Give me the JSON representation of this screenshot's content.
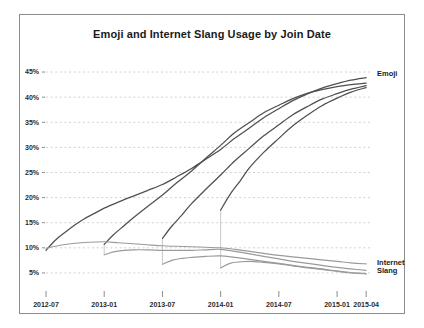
{
  "chart_data": {
    "type": "line",
    "title": "Emoji and Internet Slang Usage by Join Date",
    "xlabel": "",
    "ylabel": "",
    "grid": true,
    "legend_position": "right-inline",
    "ylim": [
      2,
      47
    ],
    "ytick_labels": [
      "45%",
      "40%",
      "35%",
      "30%",
      "25%",
      "20%",
      "15%",
      "10%",
      "5%"
    ],
    "ytick_values": [
      45,
      40,
      35,
      30,
      25,
      20,
      15,
      10,
      5
    ],
    "xtick_labels": [
      "2012-07",
      "2013-01",
      "2013-07",
      "2014-01",
      "2014-07",
      "2015-01",
      "2015-04"
    ],
    "xtick_values": [
      2012.5,
      2013.0,
      2013.5,
      2014.0,
      2014.5,
      2015.0,
      2015.25
    ],
    "xlim": [
      2012.5,
      2015.3
    ],
    "series_labels": {
      "emoji": "Emoji",
      "internet": "Internet",
      "slang": "Slang"
    },
    "series": [
      {
        "name": "Emoji — cohort joined 2012-07",
        "group": "emoji",
        "color": "#4f4f4f",
        "x": [
          2012.5,
          2012.58,
          2012.67,
          2012.75,
          2012.83,
          2012.92,
          2013.0,
          2013.12,
          2013.25,
          2013.37,
          2013.5,
          2013.62,
          2013.75,
          2013.87,
          2014.0,
          2014.12,
          2014.25,
          2014.37,
          2014.5,
          2014.62,
          2014.75,
          2014.87,
          2015.0,
          2015.12,
          2015.25
        ],
        "values": [
          9.5,
          11.5,
          13.2,
          14.6,
          15.8,
          16.9,
          17.9,
          19.1,
          20.3,
          21.4,
          22.6,
          24.1,
          25.8,
          27.6,
          29.6,
          31.8,
          33.9,
          35.9,
          37.7,
          39.3,
          40.7,
          41.8,
          42.7,
          43.4,
          43.9
        ]
      },
      {
        "name": "Emoji — cohort joined 2013-01",
        "group": "emoji",
        "color": "#4f4f4f",
        "x": [
          2013.0,
          2013.08,
          2013.17,
          2013.25,
          2013.37,
          2013.5,
          2013.62,
          2013.75,
          2013.87,
          2014.0,
          2014.12,
          2014.25,
          2014.37,
          2014.5,
          2014.62,
          2014.75,
          2014.87,
          2015.0,
          2015.12,
          2015.25
        ],
        "values": [
          10.7,
          12.6,
          14.4,
          16.0,
          18.2,
          20.5,
          22.9,
          25.3,
          27.8,
          30.4,
          32.9,
          35.0,
          36.9,
          38.4,
          39.7,
          40.8,
          41.5,
          42.1,
          42.5,
          42.8
        ]
      },
      {
        "name": "Emoji — cohort joined 2013-07",
        "group": "emoji",
        "color": "#4f4f4f",
        "x": [
          2013.5,
          2013.58,
          2013.67,
          2013.75,
          2013.87,
          2014.0,
          2014.12,
          2014.25,
          2014.37,
          2014.5,
          2014.62,
          2014.75,
          2014.87,
          2015.0,
          2015.12,
          2015.25
        ],
        "values": [
          11.9,
          14.3,
          16.6,
          18.8,
          21.6,
          24.5,
          27.3,
          29.9,
          32.3,
          34.5,
          36.5,
          38.2,
          39.6,
          40.7,
          41.6,
          42.3
        ]
      },
      {
        "name": "Emoji — cohort joined 2014-01",
        "group": "emoji",
        "color": "#4f4f4f",
        "x": [
          2014.0,
          2014.08,
          2014.17,
          2014.25,
          2014.37,
          2014.5,
          2014.62,
          2014.75,
          2014.87,
          2015.0,
          2015.12,
          2015.25
        ],
        "values": [
          17.5,
          20.6,
          23.4,
          26.0,
          29.0,
          31.8,
          34.3,
          36.5,
          38.3,
          39.8,
          41.0,
          41.9
        ]
      },
      {
        "name": "Internet Slang — cohort joined 2012-07",
        "group": "slang",
        "color": "#9a9a9a",
        "x": [
          2012.5,
          2012.62,
          2012.75,
          2012.87,
          2013.0,
          2013.12,
          2013.25,
          2013.37,
          2013.5,
          2013.62,
          2013.75,
          2013.87,
          2014.0,
          2014.12,
          2014.25,
          2014.37,
          2014.5,
          2014.62,
          2014.75,
          2014.87,
          2015.0,
          2015.12,
          2015.25
        ],
        "values": [
          9.9,
          10.5,
          10.9,
          11.1,
          11.2,
          11.0,
          10.8,
          10.6,
          10.4,
          10.3,
          10.2,
          10.1,
          10.0,
          9.7,
          9.3,
          8.9,
          8.5,
          8.2,
          7.9,
          7.6,
          7.3,
          7.0,
          6.8
        ]
      },
      {
        "name": "Internet Slang — cohort joined 2013-01",
        "group": "slang",
        "color": "#9a9a9a",
        "x": [
          2013.0,
          2013.08,
          2013.17,
          2013.25,
          2013.37,
          2013.5,
          2013.62,
          2013.75,
          2013.87,
          2014.0,
          2014.12,
          2014.25,
          2014.37,
          2014.5,
          2014.62,
          2014.75,
          2014.87,
          2015.0,
          2015.12,
          2015.25
        ],
        "values": [
          8.6,
          9.2,
          9.5,
          9.6,
          9.6,
          9.5,
          9.5,
          9.5,
          9.6,
          9.7,
          9.3,
          8.8,
          8.3,
          7.8,
          7.3,
          6.9,
          6.5,
          6.1,
          5.8,
          5.5
        ]
      },
      {
        "name": "Internet Slang — cohort joined 2013-07",
        "group": "slang",
        "color": "#9a9a9a",
        "x": [
          2013.5,
          2013.58,
          2013.67,
          2013.75,
          2013.87,
          2014.0,
          2014.12,
          2014.25,
          2014.37,
          2014.5,
          2014.62,
          2014.75,
          2014.87,
          2015.0,
          2015.12,
          2015.25
        ],
        "values": [
          6.7,
          7.5,
          7.9,
          8.1,
          8.3,
          8.4,
          8.1,
          7.7,
          7.3,
          6.9,
          6.5,
          6.1,
          5.8,
          5.4,
          5.1,
          4.9
        ]
      },
      {
        "name": "Internet Slang — cohort joined 2014-01",
        "group": "slang",
        "color": "#9a9a9a",
        "x": [
          2014.0,
          2014.08,
          2014.17,
          2014.25,
          2014.37,
          2014.5,
          2014.62,
          2014.75,
          2014.87,
          2015.0,
          2015.12,
          2015.25
        ],
        "values": [
          6.0,
          6.9,
          7.2,
          7.3,
          7.1,
          6.8,
          6.4,
          6.0,
          5.7,
          5.3,
          5.0,
          4.8
        ]
      }
    ],
    "cohort_drops": [
      {
        "x": 2013.0,
        "from": 10.7,
        "to": 8.6
      },
      {
        "x": 2013.5,
        "from": 11.9,
        "to": 6.7
      },
      {
        "x": 2014.0,
        "from": 17.5,
        "to": 6.0
      }
    ]
  }
}
